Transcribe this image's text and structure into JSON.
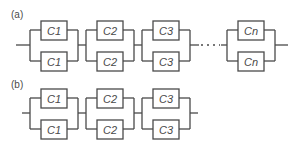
{
  "diagram": {
    "panels": [
      {
        "label": "(a)",
        "groups": [
          {
            "top": "C1",
            "bottom": "C1"
          },
          {
            "top": "C2",
            "bottom": "C2"
          },
          {
            "top": "C3",
            "bottom": "C3"
          },
          {
            "top": "Cn",
            "bottom": "Cn"
          }
        ],
        "ellipsis": "····"
      },
      {
        "label": "(b)",
        "groups": [
          {
            "top": "C1",
            "bottom": "C1"
          },
          {
            "top": "C2",
            "bottom": "C2"
          },
          {
            "top": "C3",
            "bottom": "C3"
          }
        ]
      }
    ],
    "colors": {
      "stroke": "#4a4a4a",
      "background": "#ffffff"
    }
  }
}
